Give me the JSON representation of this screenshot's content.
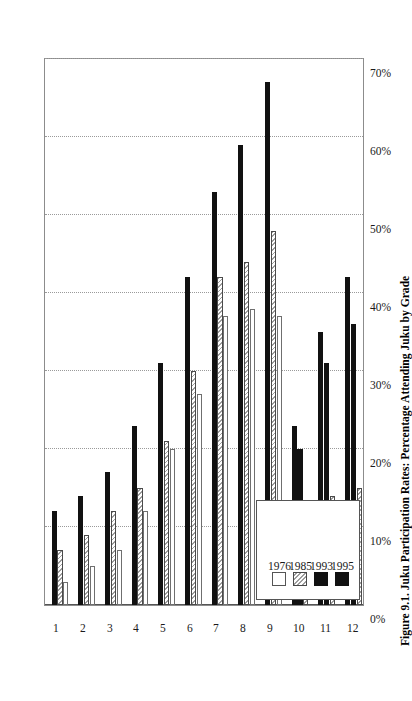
{
  "figure": {
    "caption": "Figure 9.1. Juku Participation Rates: Percentage Attending Juku by Grade",
    "orientation": "rotated-90-ccw"
  },
  "legend": {
    "position": "bottom-left-of-plot",
    "entries": [
      {
        "label": "1976",
        "fill": "white",
        "color": "#ffffff"
      },
      {
        "label": "1985",
        "fill": "hatch",
        "color": "#9d9d9d"
      },
      {
        "label": "1993",
        "fill": "solid",
        "color": "#111111"
      },
      {
        "label": "1995",
        "fill": "solid",
        "color": "#111111"
      }
    ]
  },
  "axis": {
    "value_ticks": [
      "0%",
      "10%",
      "20%",
      "30%",
      "40%",
      "50%",
      "60%",
      "70%"
    ],
    "category_ticks": [
      "1",
      "2",
      "3",
      "4",
      "5",
      "6",
      "7",
      "8",
      "9",
      "10",
      "11",
      "12"
    ]
  },
  "chart_data": {
    "type": "bar",
    "title": "Figure 9.1. Juku Participation Rates: Percentage Attending Juku by Grade",
    "xlabel": "Grade",
    "ylabel": "Percentage Attending Juku",
    "ylim": [
      0,
      70
    ],
    "grid": true,
    "legend_position": "bottom-left",
    "orientation": "horizontal-bars",
    "categories": [
      "1",
      "2",
      "3",
      "4",
      "5",
      "6",
      "7",
      "8",
      "9",
      "10",
      "11",
      "12"
    ],
    "tick_labels": [
      "0%",
      "10%",
      "20%",
      "30%",
      "40%",
      "50%",
      "60%",
      "70%"
    ],
    "series": [
      {
        "name": "1976",
        "color": "#ffffff",
        "fill": "white",
        "values": [
          3,
          5,
          7,
          12,
          20,
          27,
          37,
          38,
          37,
          0,
          0,
          0
        ]
      },
      {
        "name": "1985",
        "color": "#9d9d9d",
        "fill": "hatch",
        "values": [
          7,
          9,
          12,
          15,
          21,
          30,
          42,
          44,
          48,
          13,
          14,
          15
        ]
      },
      {
        "name": "1993",
        "color": "#111111",
        "fill": "solid",
        "values": [
          0,
          0,
          0,
          0,
          0,
          0,
          0,
          0,
          0,
          20,
          31,
          36
        ]
      },
      {
        "name": "1995",
        "color": "#111111",
        "fill": "solid",
        "values": [
          12,
          14,
          17,
          23,
          31,
          42,
          53,
          59,
          67,
          23,
          35,
          42
        ]
      }
    ]
  }
}
